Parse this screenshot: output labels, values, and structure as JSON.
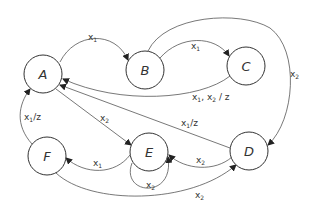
{
  "diagram": {
    "type": "state-machine",
    "nodes": [
      {
        "id": "A",
        "label": "A"
      },
      {
        "id": "B",
        "label": "B"
      },
      {
        "id": "C",
        "label": "C"
      },
      {
        "id": "D",
        "label": "D"
      },
      {
        "id": "E",
        "label": "E"
      },
      {
        "id": "F",
        "label": "F"
      }
    ],
    "edges": [
      {
        "from": "A",
        "to": "B",
        "label": "x1"
      },
      {
        "from": "B",
        "to": "C",
        "label": "x1"
      },
      {
        "from": "B",
        "to": "D",
        "label": "x2"
      },
      {
        "from": "C",
        "to": "A",
        "label": "x1, x2 / z"
      },
      {
        "from": "D",
        "to": "A",
        "label": "x1 / z"
      },
      {
        "from": "A",
        "to": "E",
        "label": "x2"
      },
      {
        "from": "E",
        "to": "F",
        "label": "x1"
      },
      {
        "from": "E",
        "to": "E",
        "label": "x2"
      },
      {
        "from": "D",
        "to": "E",
        "label": "x2"
      },
      {
        "from": "F",
        "to": "A",
        "label": "x1 / z"
      },
      {
        "from": "F",
        "to": "D",
        "label": "x2"
      }
    ]
  }
}
